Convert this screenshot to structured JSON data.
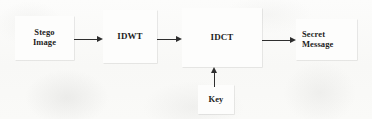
{
  "diagram": {
    "background_color": "#fbfbfa",
    "stroke_color": "#2e2e2e",
    "text_color": "#1d1d1d",
    "nodes": [
      {
        "id": "stego-image",
        "label": "Stego\nImage",
        "label_line1": "Stego",
        "label_line2": "Image",
        "shape": "rectangle"
      },
      {
        "id": "idwt",
        "label": "IDWT",
        "shape": "rectangle"
      },
      {
        "id": "idct",
        "label": "IDCT",
        "shape": "rectangle"
      },
      {
        "id": "secret-message",
        "label": "Secret\nMessage",
        "label_line1": "Secret",
        "label_line2": "Message",
        "shape": "rectangle"
      },
      {
        "id": "key",
        "label": "Key",
        "shape": "rectangle"
      }
    ],
    "edges": [
      {
        "id": "stego-to-idwt",
        "from": "stego-image",
        "to": "idwt",
        "direction": "right",
        "label": ""
      },
      {
        "id": "idwt-to-idct",
        "from": "idwt",
        "to": "idct",
        "direction": "right",
        "label": ""
      },
      {
        "id": "idct-to-secret",
        "from": "idct",
        "to": "secret-message",
        "direction": "right",
        "label": ""
      },
      {
        "id": "key-to-idct",
        "from": "key",
        "to": "idct",
        "direction": "up",
        "label": ""
      }
    ]
  }
}
